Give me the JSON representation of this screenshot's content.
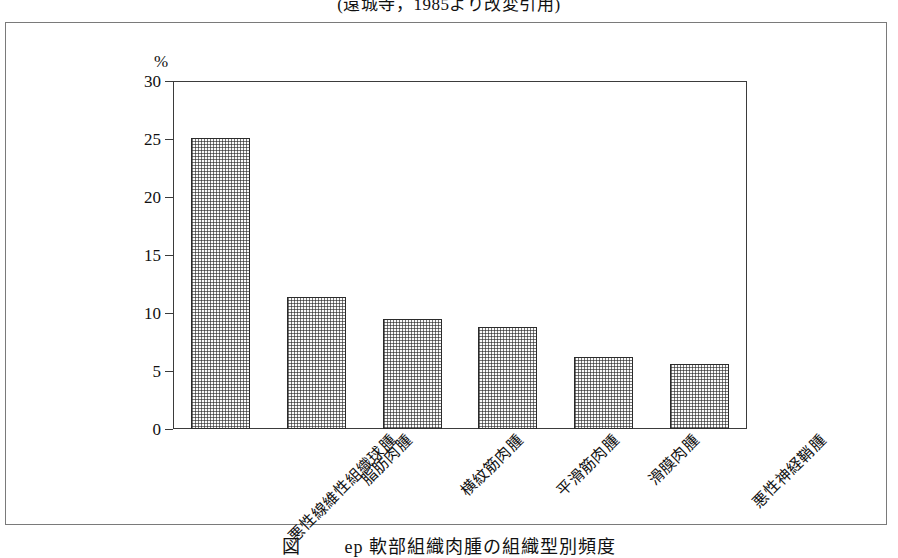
{
  "source_caption": "(遠城寺，1985より改変引用)",
  "figure_caption": "図　　  ер 軟部組織肉腫の組織型別頻度",
  "chart_data": {
    "type": "bar",
    "title": "",
    "subtitle": "",
    "xlabel": "",
    "ylabel": "%",
    "y_unit": "%",
    "ylim": [
      0,
      30
    ],
    "yticks": [
      0,
      5,
      10,
      15,
      20,
      25,
      30
    ],
    "ytick_labels": [
      "0",
      "5",
      "10",
      "15",
      "20",
      "25",
      "30"
    ],
    "grid": false,
    "legend": false,
    "categories": [
      "悪性線維性組織球腫",
      "脂肪肉腫",
      "横紋筋肉腫",
      "平滑筋肉腫",
      "滑膜肉腫",
      "悪性神経鞘腫"
    ],
    "values": [
      25.1,
      11.4,
      9.5,
      8.8,
      6.2,
      5.6
    ],
    "bar_fill": "#fbfbfb",
    "bar_pattern": "fine-dotted-stipple",
    "bar_edge_color": "#2b2b2b",
    "axis_color": "#3b3b3b",
    "frame_color": "#7a7a7a"
  }
}
